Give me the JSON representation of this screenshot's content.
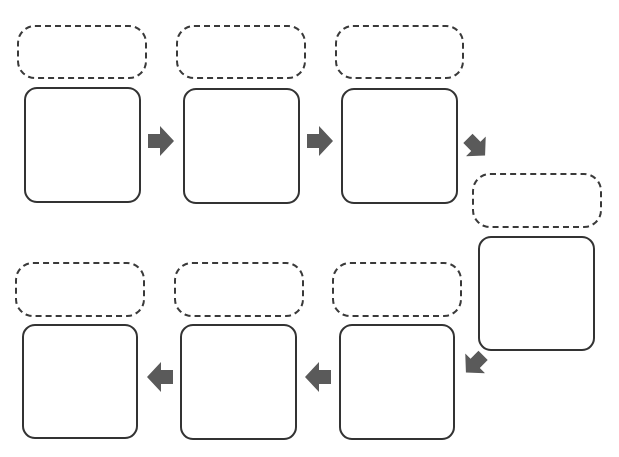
{
  "diagram": {
    "type": "sequence-chain-organizer",
    "title_fragment": "",
    "arrow_color": "#5a5a5a",
    "border_color": "#333333",
    "steps": [
      {
        "index": 1,
        "label": "",
        "content": "",
        "row": "top",
        "arrow_after": "right"
      },
      {
        "index": 2,
        "label": "",
        "content": "",
        "row": "top",
        "arrow_after": "right"
      },
      {
        "index": 3,
        "label": "",
        "content": "",
        "row": "top",
        "arrow_after": "down-right"
      },
      {
        "index": 4,
        "label": "",
        "content": "",
        "row": "right",
        "arrow_after": "down-left"
      },
      {
        "index": 5,
        "label": "",
        "content": "",
        "row": "bottom",
        "arrow_after": "left"
      },
      {
        "index": 6,
        "label": "",
        "content": "",
        "row": "bottom",
        "arrow_after": "left"
      },
      {
        "index": 7,
        "label": "",
        "content": "",
        "row": "bottom",
        "arrow_after": null
      }
    ]
  }
}
